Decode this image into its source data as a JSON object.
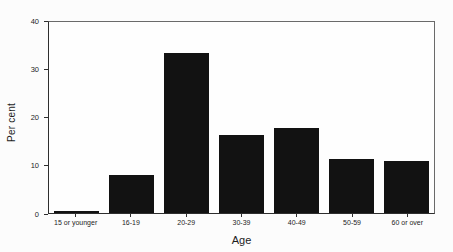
{
  "chart_data": {
    "type": "bar",
    "title": "",
    "xlabel": "Age",
    "ylabel": "Per cent",
    "categories": [
      "15 or younger",
      "16-19",
      "20-29",
      "30-39",
      "40-49",
      "50-59",
      "60 or over"
    ],
    "values": [
      0.5,
      8,
      33.5,
      16.3,
      17.8,
      11.4,
      10.9
    ],
    "ylim": [
      0,
      40
    ],
    "yticks": [
      0,
      10,
      20,
      30,
      40
    ],
    "bar_color": "#121212",
    "axis_color": "#2e2e2e",
    "grid": "off",
    "legend": "none"
  }
}
